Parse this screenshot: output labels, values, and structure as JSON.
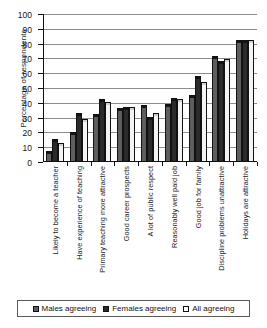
{
  "chart_data": {
    "type": "bar",
    "title": "",
    "xlabel": "",
    "ylabel": "Percentage of respondents",
    "ylim": [
      0,
      100
    ],
    "yticks": [
      0,
      10,
      20,
      30,
      40,
      50,
      60,
      70,
      80,
      90,
      100
    ],
    "grid": true,
    "legend_position": "bottom",
    "categories": [
      "Likely to become a teacher",
      "Have experience of teaching",
      "Primary teaching more attractive",
      "Good career prospects",
      "A lot of public respect",
      "Reasonably well paid job",
      "Good job for family",
      "Discipline problems unattractive",
      "Holidays are attractive"
    ],
    "series": [
      {
        "name": "Males agreeing",
        "values": [
          6,
          19,
          31,
          35,
          37,
          38,
          44,
          70,
          81
        ]
      },
      {
        "name": "Females agreeing",
        "values": [
          14,
          32,
          41,
          36,
          29,
          42,
          57,
          67,
          81
        ]
      },
      {
        "name": "All agreeing",
        "values": [
          11.5,
          28,
          39,
          35.5,
          31.5,
          41,
          53,
          68,
          81
        ]
      }
    ]
  },
  "legend": {
    "items": [
      {
        "label": "Males agreeing",
        "key": "males"
      },
      {
        "label": "Females agreeing",
        "key": "females"
      },
      {
        "label": "All agreeing",
        "key": "all"
      }
    ]
  },
  "colors": {
    "males": "#5e5e5e",
    "females": "#2b2b2b",
    "all": "#f4f4f4",
    "axis": "#111111",
    "gridline": "#8d8d8d",
    "background": "#ffffff"
  }
}
